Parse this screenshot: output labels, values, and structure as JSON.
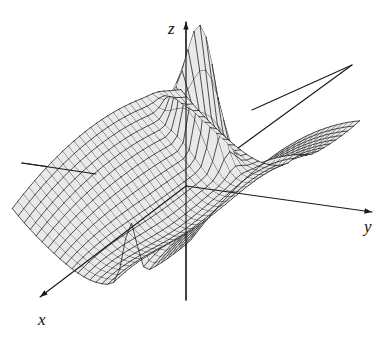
{
  "figure": {
    "kind": "3d-surface-plot",
    "caption": "",
    "background_color": "#ffffff",
    "surface_fill_color": "#e9e9e9",
    "mesh_line_color": "#111111",
    "axis_color": "#1a1a1a",
    "width": 386,
    "height": 342
  },
  "axes": {
    "z": {
      "label": "z",
      "direction": "up",
      "arrow": true,
      "tip": [
        186,
        22
      ],
      "base": [
        186,
        300
      ],
      "label_pos": [
        168,
        34
      ]
    },
    "y": {
      "label": "y",
      "direction": "right",
      "arrow": true,
      "tip": [
        372,
        212
      ],
      "base": [
        186,
        186
      ],
      "label_pos": [
        364,
        232
      ]
    },
    "x": {
      "label": "x",
      "direction": "lower-left",
      "arrow": true,
      "tip": [
        40,
        297
      ],
      "base": [
        186,
        186
      ],
      "label_pos": [
        38,
        325
      ]
    },
    "negative_y_stub": {
      "from": [
        186,
        186
      ],
      "to": [
        22,
        163
      ]
    },
    "negative_x_stub": {
      "from": [
        186,
        186
      ],
      "to": [
        352,
        65
      ]
    }
  },
  "chart_data": {
    "type": "surface",
    "title": "",
    "xlabel": "x",
    "ylabel": "y",
    "zlabel": "z",
    "function": "saddle surface with a sharp spike at the back-left corner and a steep fold ridge on the right",
    "u_range": [
      -1.0,
      1.0
    ],
    "v_range": [
      -1.0,
      1.0
    ],
    "u_samples": 30,
    "v_samples": 30,
    "projection": {
      "origin": [
        186,
        186
      ],
      "u_axis_px": [
        -1.62,
        1.32
      ],
      "v_axis_px": [
        1.72,
        0.3
      ],
      "z_scale_px": -118
    },
    "surface_terms": [
      {
        "name": "saddle",
        "coeff": 0.52,
        "expr": "v*v - 0.55*u*u"
      },
      {
        "name": "valley",
        "coeff": -0.46,
        "expr": "exp(-4.2*(v*v + 0.30*u*u))"
      },
      {
        "name": "spike",
        "coeff": 1.28,
        "expr": "exp(-((u+0.72)^2)/0.012 - ((v+0.52)^2)/0.055)"
      },
      {
        "name": "ridge_fold",
        "coeff": 0.62,
        "expr": "exp(-((v-0.32)^2)/0.010)*(0.55 + 0.45*u)"
      },
      {
        "name": "tilt",
        "coeff": 0.1,
        "expr": "u"
      }
    ],
    "grid": {
      "u_lines": 30,
      "v_lines": 30,
      "visible": true
    },
    "legend": {
      "visible": false
    },
    "tick_labels": {
      "x": [],
      "y": [],
      "z": []
    },
    "annotations": []
  }
}
